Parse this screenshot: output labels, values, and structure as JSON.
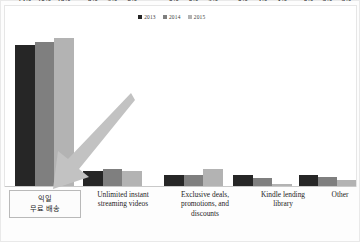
{
  "chart_data": {
    "type": "bar",
    "title": "",
    "subtitle": "",
    "xlabel": "",
    "ylabel": "",
    "ylim": [
      0,
      100
    ],
    "grid": false,
    "legend_position": "top-center",
    "value_suffix": "%",
    "categories": [
      "익일\n무료 배송",
      "Unlimited instant streaming videos",
      "Exclusive deals, promotions, and discounts",
      "Kindle lending library",
      "Other"
    ],
    "series": [
      {
        "name": "2013",
        "color": "#262626",
        "values": [
          74,
          8,
          6,
          6,
          6
        ]
      },
      {
        "name": "2014",
        "color": "#7f7f7f",
        "values": [
          76,
          9,
          6,
          4,
          5
        ]
      },
      {
        "name": "2015",
        "color": "#b3b3b3",
        "values": [
          78,
          8,
          9,
          1,
          3
        ]
      }
    ],
    "data_labels": [
      [
        "74%",
        "76%",
        "78%"
      ],
      [
        "8%",
        "9%",
        "8%"
      ],
      [
        "6%",
        "6%",
        "9%"
      ],
      [
        "6%",
        "4%",
        "1%"
      ],
      [
        "6%",
        "5%",
        "3%"
      ]
    ]
  },
  "legend": {
    "items": [
      {
        "label": "2013",
        "color": "#262626"
      },
      {
        "label": "2014",
        "color": "#7f7f7f"
      },
      {
        "label": "2015",
        "color": "#b3b3b3"
      }
    ]
  },
  "categories_display": [
    {
      "lines": [
        "익일",
        "무료 배송"
      ],
      "boxed": true
    },
    {
      "lines": [
        "Unlimited instant",
        "streaming videos"
      ],
      "boxed": false
    },
    {
      "lines": [
        "Exclusive deals,",
        "promotions, and",
        "discounts"
      ],
      "boxed": false
    },
    {
      "lines": [
        "Kindle lending",
        "library"
      ],
      "boxed": false
    },
    {
      "lines": [
        "Other"
      ],
      "boxed": false
    }
  ],
  "annotations": {
    "arrow": {
      "name": "highlight-arrow",
      "color": "#c2c2c2",
      "direction": "down-left"
    }
  },
  "colors": {
    "series_2013": "#262626",
    "series_2014": "#7f7f7f",
    "series_2015": "#b3b3b3",
    "frame": "#e6e6e6",
    "baseline": "#c9c9c9",
    "box_border": "#b9b9b9"
  }
}
